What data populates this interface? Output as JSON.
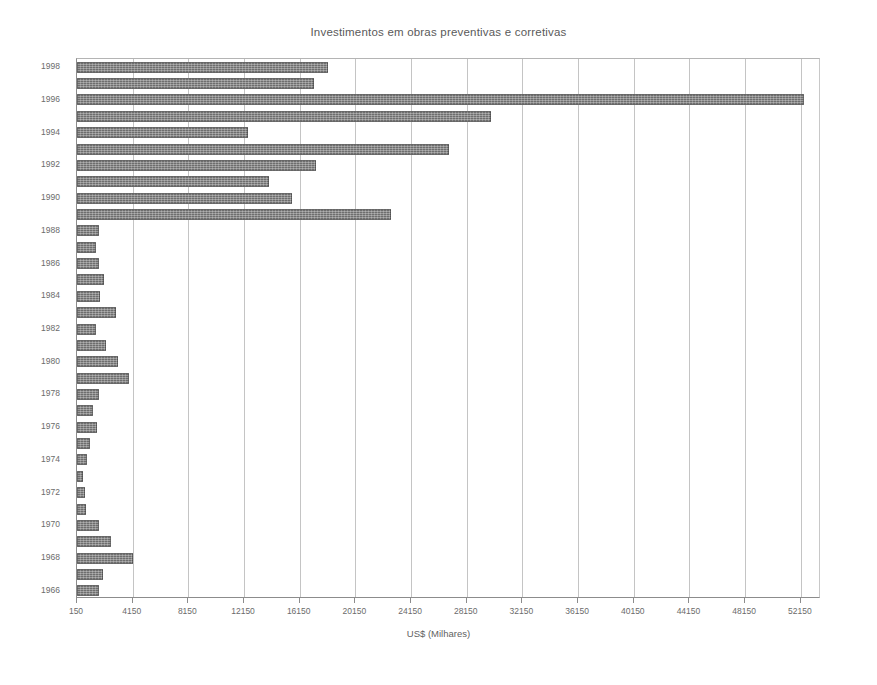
{
  "chart_data": {
    "type": "bar",
    "orientation": "horizontal",
    "title": "Investimentos em obras preventivas e corretivas",
    "xlabel": "US$ (Milhares)",
    "ylabel": "",
    "xlim": [
      150,
      53600
    ],
    "xticks": [
      150,
      4150,
      8150,
      12150,
      16150,
      20150,
      24150,
      28150,
      32150,
      36150,
      40150,
      44150,
      48150,
      52150
    ],
    "xticklabels": [
      "150",
      "4150",
      "8150",
      "12150",
      "16150",
      "20150",
      "24150",
      "28150",
      "32150",
      "36150",
      "40150",
      "44150",
      "48150",
      "52150"
    ],
    "yticklabels": [
      "1998",
      "1996",
      "1994",
      "1992",
      "1990",
      "1988",
      "1986",
      "1984",
      "1982",
      "1980",
      "1978",
      "1976",
      "1974",
      "1972",
      "1970",
      "1968",
      "1966"
    ],
    "grid": true,
    "legend": false,
    "bar_color": "#6e6e6e",
    "categories": [
      "1998",
      "1997",
      "1996",
      "1995",
      "1994",
      "1993",
      "1992",
      "1991",
      "1990",
      "1989",
      "1988",
      "1987",
      "1986",
      "1985",
      "1984",
      "1983",
      "1982",
      "1981",
      "1980",
      "1979",
      "1978",
      "1977",
      "1976",
      "1975",
      "1974",
      "1973",
      "1972",
      "1971",
      "1970",
      "1969",
      "1968",
      "1967",
      "1966"
    ],
    "values": [
      18150,
      17200,
      52400,
      29900,
      12450,
      26900,
      17300,
      13950,
      15600,
      22700,
      1700,
      1500,
      1750,
      2100,
      1800,
      2950,
      1550,
      2200,
      3100,
      3850,
      1750,
      1300,
      1600,
      1050,
      900,
      600,
      700,
      800,
      1700,
      2600,
      4150,
      2000,
      1750
    ]
  },
  "axis": {
    "x_title": "US$ (Milhares)"
  }
}
